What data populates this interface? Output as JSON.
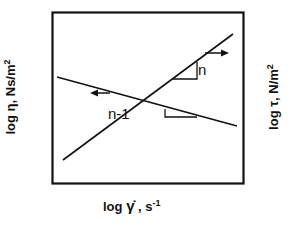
{
  "diagram": {
    "title": "",
    "x_axis_label": {
      "log": "log",
      "symbol": "γ̇",
      "unit": ", s",
      "unit_exp": "-1"
    },
    "y_axis_left_label": {
      "log": "log",
      "symbol": "η",
      "unit": ", Ns/m",
      "unit_exp": "2"
    },
    "y_axis_right_label": {
      "log": "log",
      "symbol": "τ",
      "unit": ", N/m",
      "unit_exp": "2"
    },
    "slope_labels": {
      "rising": "n",
      "falling": "n-1"
    },
    "lines": [
      {
        "name": "shear-stress-line",
        "quantity": "log τ",
        "slope": "n",
        "direction": "rising",
        "arrow": "right"
      },
      {
        "name": "viscosity-line",
        "quantity": "log η",
        "slope": "n-1",
        "direction": "falling",
        "arrow": "left"
      }
    ],
    "colors": {
      "ink": "#111111",
      "background": "#ffffff"
    }
  }
}
